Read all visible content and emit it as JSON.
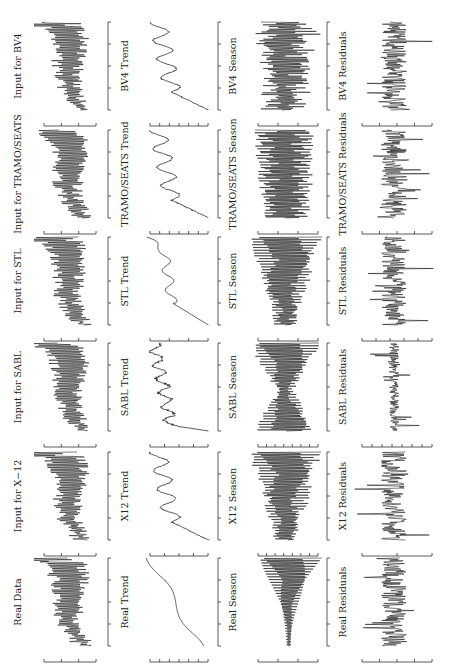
{
  "figure": {
    "orientation": "rotated-90-ccw",
    "width": 450,
    "height": 666,
    "line_color": "#111111",
    "axis_color": "#333333"
  },
  "chart_data": {
    "type": "line",
    "layout": "grid 6 rows x 4 columns (rotated 90 degrees counter-clockwise)",
    "rows": [
      "BV4",
      "TRAMO/SEATS",
      "STL",
      "SABL",
      "X-12",
      "Real"
    ],
    "columns": [
      "Input",
      "Trend",
      "Season",
      "Residuals"
    ],
    "x_ticks_count": 5,
    "panels": [
      {
        "row": 0,
        "col": 0,
        "title": "Input for BV4",
        "kind": "input",
        "y_ticks": 4
      },
      {
        "row": 0,
        "col": 1,
        "title": "BV4 Trend",
        "kind": "trend-wavy",
        "y_ticks": 7
      },
      {
        "row": 0,
        "col": 2,
        "title": "BV4 Season",
        "kind": "season-noisy",
        "y_ticks": 4
      },
      {
        "row": 0,
        "col": 3,
        "title": "BV4 Residuals",
        "kind": "residuals",
        "y_ticks": 5
      },
      {
        "row": 1,
        "col": 0,
        "title": "Input for TRAMO/SEATS",
        "kind": "input",
        "y_ticks": 4
      },
      {
        "row": 1,
        "col": 1,
        "title": "TRAMO/SEATS Trend",
        "kind": "trend-wavy",
        "y_ticks": 7
      },
      {
        "row": 1,
        "col": 2,
        "title": "TRAMO/SEATS Season",
        "kind": "season-regular",
        "y_ticks": 4
      },
      {
        "row": 1,
        "col": 3,
        "title": "TRAMO/SEATS Residuals",
        "kind": "residuals",
        "y_ticks": 5
      },
      {
        "row": 2,
        "col": 0,
        "title": "Input for STL",
        "kind": "input",
        "y_ticks": 4
      },
      {
        "row": 2,
        "col": 1,
        "title": "STL Trend",
        "kind": "trend-smooth-wavy",
        "y_ticks": 4
      },
      {
        "row": 2,
        "col": 2,
        "title": "STL Season",
        "kind": "season-growing",
        "y_ticks": 4
      },
      {
        "row": 2,
        "col": 3,
        "title": "STL Residuals",
        "kind": "residuals",
        "y_ticks": 6
      },
      {
        "row": 3,
        "col": 0,
        "title": "Input for SABL",
        "kind": "input",
        "y_ticks": 4
      },
      {
        "row": 3,
        "col": 1,
        "title": "SABL Trend",
        "kind": "trend-step",
        "y_ticks": 5
      },
      {
        "row": 3,
        "col": 2,
        "title": "SABL Season",
        "kind": "season-hourglass",
        "y_ticks": 8
      },
      {
        "row": 3,
        "col": 3,
        "title": "SABL Residuals",
        "kind": "residuals-small",
        "y_ticks": 8
      },
      {
        "row": 4,
        "col": 0,
        "title": "Input for X−12",
        "kind": "input",
        "y_ticks": 4
      },
      {
        "row": 4,
        "col": 1,
        "title": "X12 Trend",
        "kind": "trend-wavy",
        "y_ticks": 5
      },
      {
        "row": 4,
        "col": 2,
        "title": "X12 Season",
        "kind": "season-growing",
        "y_ticks": 8
      },
      {
        "row": 4,
        "col": 3,
        "title": "X12 Residuals",
        "kind": "residuals",
        "y_ticks": 3
      },
      {
        "row": 5,
        "col": 0,
        "title": "Real Data",
        "kind": "input",
        "y_ticks": 4
      },
      {
        "row": 5,
        "col": 1,
        "title": "Real Trend",
        "kind": "trend-sigmoid",
        "y_ticks": 7
      },
      {
        "row": 5,
        "col": 2,
        "title": "Real Season",
        "kind": "season-fan",
        "y_ticks": 4
      },
      {
        "row": 5,
        "col": 3,
        "title": "Real Residuals",
        "kind": "residuals",
        "y_ticks": 5
      }
    ],
    "xlabel": "",
    "ylabel": "",
    "grid": false,
    "legend": null
  }
}
